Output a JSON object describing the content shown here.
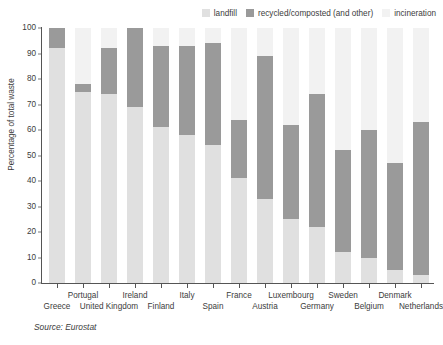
{
  "chart_data": {
    "type": "bar",
    "subtype": "stacked-100-percent",
    "title": "",
    "xlabel": "",
    "ylabel": "Percentage of total waste",
    "ylim": [
      0,
      100
    ],
    "yticks": [
      0,
      10,
      20,
      30,
      40,
      50,
      60,
      70,
      80,
      90,
      100
    ],
    "grid": false,
    "legend_position": "top-right",
    "source_note": "Source: Eurostat",
    "categories": [
      "Greece",
      "Portugal",
      "United Kingdom",
      "Ireland",
      "Finland",
      "Italy",
      "Spain",
      "France",
      "Austria",
      "Luxembourg",
      "Germany",
      "Sweden",
      "Belgium",
      "Denmark",
      "Netherlands"
    ],
    "series": [
      {
        "name": "landfill",
        "color": "#e0e0e0",
        "values": [
          92,
          75,
          74,
          69,
          61,
          58,
          54,
          41,
          33,
          25,
          22,
          12,
          10,
          5,
          3
        ]
      },
      {
        "name": "recycled/composted (and other)",
        "color": "#9a9a9a",
        "values": [
          8,
          3,
          18,
          31,
          32,
          35,
          40,
          23,
          56,
          37,
          52,
          40,
          50,
          42,
          60
        ]
      },
      {
        "name": "incineration",
        "color": "#f2f2f2",
        "values": [
          0,
          22,
          8,
          0,
          7,
          7,
          6,
          36,
          11,
          38,
          26,
          48,
          40,
          53,
          37
        ]
      }
    ],
    "segment_bounds": [
      {
        "category": "Greece",
        "landfill_top": 92,
        "recycled_top": 100
      },
      {
        "category": "Portugal",
        "landfill_top": 75,
        "recycled_top": 78
      },
      {
        "category": "United Kingdom",
        "landfill_top": 74,
        "recycled_top": 92
      },
      {
        "category": "Ireland",
        "landfill_top": 69,
        "recycled_top": 100
      },
      {
        "category": "Finland",
        "landfill_top": 61,
        "recycled_top": 93
      },
      {
        "category": "Italy",
        "landfill_top": 58,
        "recycled_top": 93
      },
      {
        "category": "Spain",
        "landfill_top": 54,
        "recycled_top": 94
      },
      {
        "category": "France",
        "landfill_top": 41,
        "recycled_top": 64
      },
      {
        "category": "Austria",
        "landfill_top": 33,
        "recycled_top": 89
      },
      {
        "category": "Luxembourg",
        "landfill_top": 25,
        "recycled_top": 62
      },
      {
        "category": "Germany",
        "landfill_top": 22,
        "recycled_top": 74
      },
      {
        "category": "Sweden",
        "landfill_top": 12,
        "recycled_top": 52
      },
      {
        "category": "Belgium",
        "landfill_top": 10,
        "recycled_top": 60
      },
      {
        "category": "Denmark",
        "landfill_top": 5,
        "recycled_top": 47
      },
      {
        "category": "Netherlands",
        "landfill_top": 3,
        "recycled_top": 63
      }
    ]
  },
  "legend": {
    "items": [
      {
        "label": "landfill",
        "color": "#e0e0e0"
      },
      {
        "label": "recycled/composted (and other)",
        "color": "#9a9a9a"
      },
      {
        "label": "incineration",
        "color": "#f2f2f2"
      }
    ]
  },
  "axis": {
    "y_title": "Percentage of total waste"
  },
  "footer": {
    "source": "Source: Eurostat"
  }
}
